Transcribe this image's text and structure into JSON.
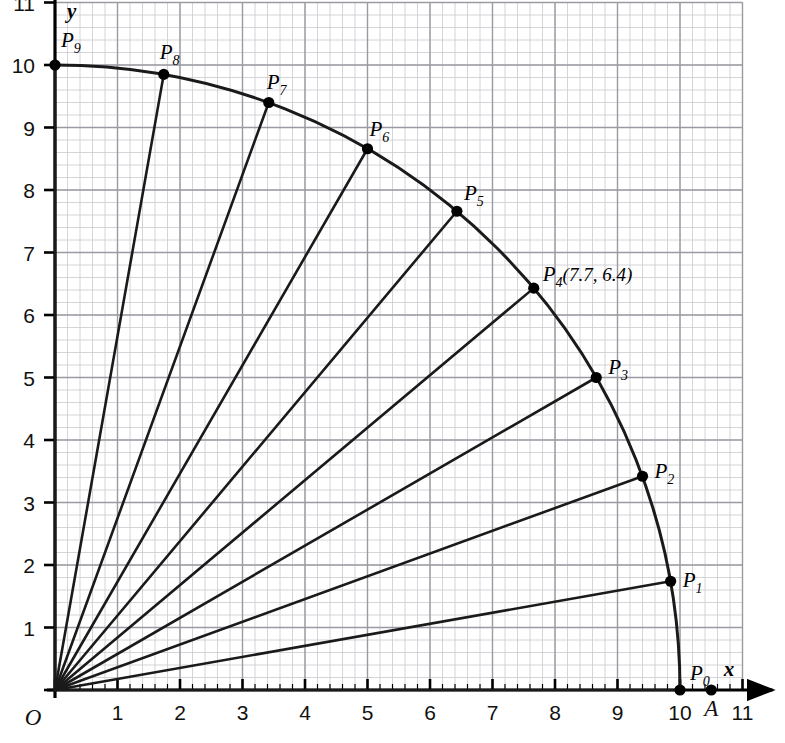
{
  "figure": {
    "origin_label": "O",
    "x_axis_label": "x",
    "y_axis_label": "y",
    "x_ticks": [
      "1",
      "2",
      "3",
      "4",
      "5",
      "6",
      "7",
      "8",
      "9",
      "10",
      "11"
    ],
    "y_ticks": [
      "1",
      "2",
      "3",
      "4",
      "5",
      "6",
      "7",
      "8",
      "9",
      "10",
      "11"
    ],
    "colors": {
      "grid_minor": "#c9c9cf",
      "grid_major": "#9a9aa3",
      "axis": "#000000",
      "curve": "#1a1a1a",
      "point": "#000000"
    }
  },
  "chart_data": {
    "type": "scatter",
    "xlabel": "x",
    "ylabel": "y",
    "xlim": [
      0,
      11
    ],
    "ylim": [
      0,
      11
    ],
    "grid": true,
    "minor_grid_divisions": 5,
    "radius": 10,
    "angle_step_degrees": 10,
    "curve": "quarter circle arc x^2 + y^2 = 100, from (10,0) to (0,10)",
    "radii_drawn_from_origin": true,
    "points": [
      {
        "label": "P",
        "sub": "0",
        "x": 10.0,
        "y": 0.0,
        "label_dx": 10,
        "label_dy": -10,
        "annotation": ""
      },
      {
        "label": "P",
        "sub": "1",
        "x": 9.85,
        "y": 1.74,
        "label_dx": 12,
        "label_dy": 6,
        "annotation": ""
      },
      {
        "label": "P",
        "sub": "2",
        "x": 9.4,
        "y": 3.42,
        "label_dx": 12,
        "label_dy": 2,
        "annotation": ""
      },
      {
        "label": "P",
        "sub": "3",
        "x": 8.66,
        "y": 5.0,
        "label_dx": 12,
        "label_dy": -4,
        "annotation": ""
      },
      {
        "label": "P",
        "sub": "4",
        "x": 7.66,
        "y": 6.43,
        "label_dx": 9,
        "label_dy": -7,
        "annotation": "(7.7, 6.4)"
      },
      {
        "label": "P",
        "sub": "5",
        "x": 6.43,
        "y": 7.66,
        "label_dx": 7,
        "label_dy": -11,
        "annotation": ""
      },
      {
        "label": "P",
        "sub": "6",
        "x": 5.0,
        "y": 8.66,
        "label_dx": 2,
        "label_dy": -13,
        "annotation": ""
      },
      {
        "label": "P",
        "sub": "7",
        "x": 3.42,
        "y": 9.4,
        "label_dx": -2,
        "label_dy": -14,
        "annotation": ""
      },
      {
        "label": "P",
        "sub": "8",
        "x": 1.74,
        "y": 9.85,
        "label_dx": -4,
        "label_dy": -15,
        "annotation": ""
      },
      {
        "label": "P",
        "sub": "9",
        "x": 0.0,
        "y": 10.0,
        "label_dx": 6,
        "label_dy": -18,
        "annotation": ""
      }
    ],
    "extra_points": [
      {
        "label": "A",
        "x": 10.5,
        "y": 0.0,
        "label_dx": 0,
        "label_dy": 26
      }
    ]
  }
}
